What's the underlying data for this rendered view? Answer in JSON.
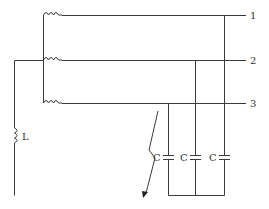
{
  "diagram": {
    "type": "three-phase circuit with grounding inductor, line capacitances and ground fault",
    "phase_labels": [
      "1",
      "2",
      "3"
    ],
    "inductor_label": "L",
    "capacitor_labels": [
      "C",
      "C",
      "C"
    ],
    "colors": {
      "line": "#3a3a3a",
      "text": "#333333",
      "background": "#ffffff"
    }
  }
}
